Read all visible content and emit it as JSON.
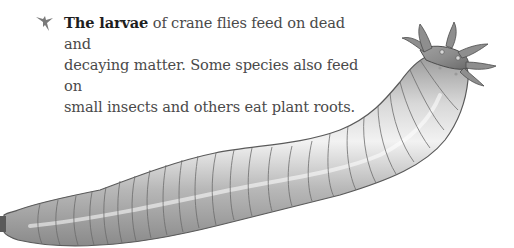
{
  "caption": {
    "icon": "crane-fly-bullet-icon",
    "lead": "The larvae",
    "lines": [
      " of crane flies feed on dead and",
      "decaying matter. Some species also feed on",
      "small insects and others eat plant roots."
    ]
  },
  "illustration": {
    "subject": "crane fly larva",
    "colors": {
      "body_light": "#e6e6e6",
      "body_mid": "#b4b4b4",
      "body_dark": "#6e6e6e",
      "outline": "#4d4d4d",
      "icon": "#7a7a7a"
    }
  }
}
